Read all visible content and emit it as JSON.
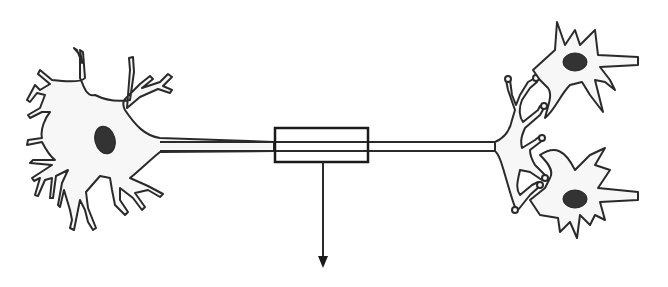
{
  "diagram": {
    "parts": [
      {
        "id": "presynaptic-neuron",
        "type": "neuron-cell-body-with-dendrites"
      },
      {
        "id": "axon",
        "type": "axon"
      },
      {
        "id": "axon-highlight-box",
        "type": "rectangle"
      },
      {
        "id": "down-arrow",
        "type": "arrow",
        "direction": "down"
      },
      {
        "id": "axon-terminals",
        "type": "synaptic-branches"
      },
      {
        "id": "postsynaptic-neuron-top",
        "type": "neuron"
      },
      {
        "id": "postsynaptic-neuron-bottom",
        "type": "neuron"
      }
    ],
    "labels": []
  },
  "colors": {
    "stroke": "#2a2a2a",
    "fill": "#f7f7f7",
    "nucleus": "#333333",
    "background": "#ffffff"
  }
}
